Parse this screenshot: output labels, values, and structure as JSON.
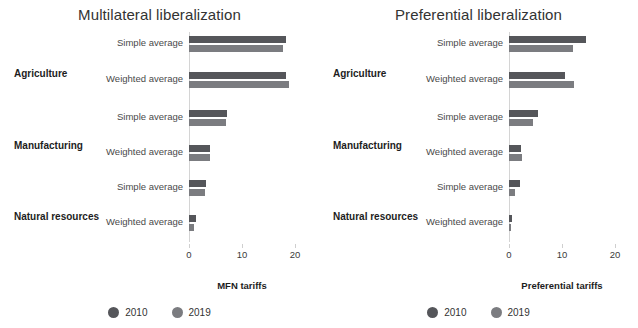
{
  "chart_data": [
    {
      "type": "bar",
      "orientation": "horizontal",
      "title": "Multilateral liberalization",
      "xlabel": "MFN tariffs",
      "ylabel": "",
      "xlim": [
        0,
        20
      ],
      "xticks": [
        0,
        10,
        20
      ],
      "xticklabels": [
        "0",
        "10",
        "20"
      ],
      "grid": false,
      "legend_position": "bottom-center",
      "groups": [
        "Agriculture",
        "Manufacturing",
        "Natural resources"
      ],
      "categories": [
        "Agriculture — Simple average",
        "Agriculture — Weighted average",
        "Manufacturing — Simple average",
        "Manufacturing — Weighted average",
        "Natural resources — Simple average",
        "Natural resources — Weighted average"
      ],
      "series": [
        {
          "name": "2010",
          "color": "#55565a",
          "values": [
            18.3,
            18.3,
            7.2,
            4.0,
            3.2,
            1.3
          ]
        },
        {
          "name": "2019",
          "color": "#7b7c80",
          "values": [
            17.7,
            18.9,
            7.0,
            4.0,
            3.0,
            0.9
          ]
        }
      ]
    },
    {
      "type": "bar",
      "orientation": "horizontal",
      "title": "Preferential liberalization",
      "xlabel": "Preferential tariffs",
      "ylabel": "",
      "xlim": [
        0,
        20
      ],
      "xticks": [
        0,
        10,
        20
      ],
      "xticklabels": [
        "0",
        "10",
        "20"
      ],
      "grid": false,
      "legend_position": "bottom-center",
      "groups": [
        "Agriculture",
        "Manufacturing",
        "Natural resources"
      ],
      "categories": [
        "Agriculture — Simple average",
        "Agriculture — Weighted average",
        "Manufacturing — Simple average",
        "Manufacturing — Weighted average",
        "Natural resources — Simple average",
        "Natural resources — Weighted average"
      ],
      "series": [
        {
          "name": "2010",
          "color": "#55565a",
          "values": [
            14.5,
            10.5,
            5.5,
            2.3,
            2.0,
            0.5
          ]
        },
        {
          "name": "2019",
          "color": "#7b7c80",
          "values": [
            12.0,
            12.2,
            4.5,
            2.5,
            1.2,
            0.2
          ]
        }
      ]
    }
  ],
  "panels": [
    {
      "title": "Multilateral liberalization",
      "axis_title": "MFN tariffs",
      "ticks": [
        "0",
        "10",
        "20"
      ],
      "groups": [
        {
          "label": "Agriculture",
          "rows": [
            {
              "label": "Simple average",
              "v2010": 18.3,
              "v2019": 17.7
            },
            {
              "label": "Weighted average",
              "v2010": 18.3,
              "v2019": 18.9
            }
          ]
        },
        {
          "label": "Manufacturing",
          "rows": [
            {
              "label": "Simple average",
              "v2010": 7.2,
              "v2019": 7.0
            },
            {
              "label": "Weighted average",
              "v2010": 4.0,
              "v2019": 4.0
            }
          ]
        },
        {
          "label": "Natural resources",
          "rows": [
            {
              "label": "Simple average",
              "v2010": 3.2,
              "v2019": 3.0
            },
            {
              "label": "Weighted average",
              "v2010": 1.3,
              "v2019": 0.9
            }
          ]
        }
      ],
      "legend": [
        {
          "label": "2010",
          "color": "#55565a"
        },
        {
          "label": "2019",
          "color": "#7b7c80"
        }
      ]
    },
    {
      "title": "Preferential liberalization",
      "axis_title": "Preferential tariffs",
      "ticks": [
        "0",
        "10",
        "20"
      ],
      "groups": [
        {
          "label": "Agriculture",
          "rows": [
            {
              "label": "Simple average",
              "v2010": 14.5,
              "v2019": 12.0
            },
            {
              "label": "Weighted average",
              "v2010": 10.5,
              "v2019": 12.2
            }
          ]
        },
        {
          "label": "Manufacturing",
          "rows": [
            {
              "label": "Simple average",
              "v2010": 5.5,
              "v2019": 4.5
            },
            {
              "label": "Weighted average",
              "v2010": 2.3,
              "v2019": 2.5
            }
          ]
        },
        {
          "label": "Natural resources",
          "rows": [
            {
              "label": "Simple average",
              "v2010": 2.0,
              "v2019": 1.2
            },
            {
              "label": "Weighted average",
              "v2010": 0.5,
              "v2019": 0.2
            }
          ]
        }
      ],
      "legend": [
        {
          "label": "2010",
          "color": "#55565a"
        },
        {
          "label": "2019",
          "color": "#7b7c80"
        }
      ]
    }
  ],
  "scale": {
    "max": 20,
    "px_per_unit": 5.3
  }
}
